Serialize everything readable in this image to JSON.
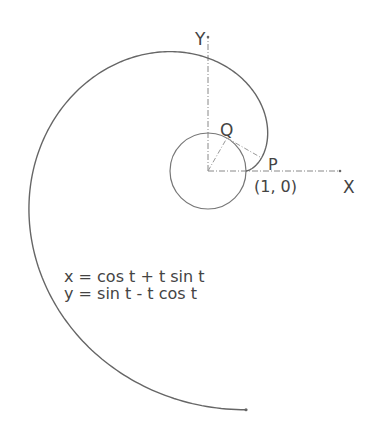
{
  "diagram": {
    "colors": {
      "stroke": "#666666",
      "text": "#444444",
      "axis": "#888888",
      "background": "#ffffff"
    },
    "geometry": {
      "origin_px": [
        208,
        171
      ],
      "unit_px": 38,
      "t_start": 0,
      "t_end": 6.2832,
      "q_t": 1.05
    },
    "labels": {
      "y_axis": "Y",
      "x_axis": "X",
      "point_q": "Q",
      "point_p": "P",
      "start_point": "(1, 0)",
      "equation_x": "x = cos t + t sin t",
      "equation_y": "y = sin t - t cos t"
    }
  }
}
